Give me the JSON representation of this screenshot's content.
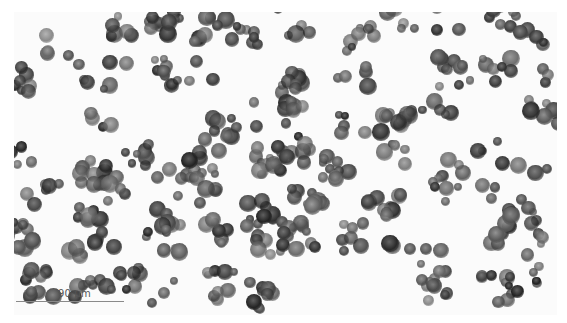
{
  "image": {
    "subject": "grayscale histology micrograph of clustered round cells",
    "background_color": "#ffffff",
    "cell_color_dark": "#2a2a2a",
    "cell_color_mid": "#6b6b6b"
  },
  "scale_bar": {
    "label": "90 µm",
    "color": "#8a8a8a"
  }
}
